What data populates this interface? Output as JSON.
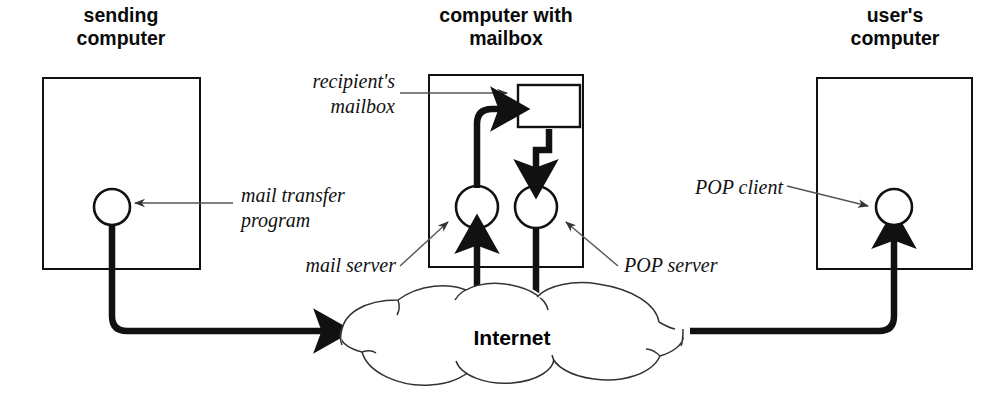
{
  "figure": {
    "title_text": "Internet",
    "headings": [
      {
        "id": "sending-computer",
        "line1": "sending",
        "line2": "computer"
      },
      {
        "id": "computer-with-mailbox",
        "line1": "computer with",
        "line2": "mailbox"
      },
      {
        "id": "users-computer",
        "line1": "user's",
        "line2": "computer"
      }
    ],
    "callouts": [
      {
        "id": "recipients-mailbox",
        "line1": "recipient's",
        "line2": "mailbox"
      },
      {
        "id": "mail-transfer-program",
        "line1": "mail transfer",
        "line2": "program"
      },
      {
        "id": "mail-server",
        "line1": "mail server",
        "line2": ""
      },
      {
        "id": "pop-server",
        "line1": "POP server",
        "line2": ""
      },
      {
        "id": "pop-client",
        "line1": "POP client",
        "line2": ""
      }
    ],
    "cloud_label": "Internet",
    "colors": {
      "ink": "#111111",
      "thin_leader": "#555555",
      "cloud_outline": "#333333",
      "background": "#ffffff"
    }
  }
}
